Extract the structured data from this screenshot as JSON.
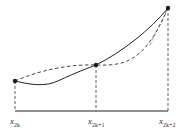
{
  "diagram": {
    "type": "simpson-rule-interpolation",
    "colors": {
      "stroke": "#222222",
      "dash": "#333333",
      "point": "#1a1a1a"
    },
    "points": [
      {
        "id": "p0",
        "x": 15,
        "y": 81
      },
      {
        "id": "p1",
        "x": 96,
        "y": 65
      },
      {
        "id": "p2",
        "x": 168,
        "y": 8
      }
    ],
    "baseline_y": 111,
    "labels": [
      {
        "base": "x",
        "sub": "2k",
        "x": 10,
        "y": 117
      },
      {
        "base": "x",
        "sub": "2k+1",
        "x": 88,
        "y": 117
      },
      {
        "base": "x",
        "sub": "2k+2",
        "x": 159,
        "y": 117
      }
    ],
    "curves": {
      "solid": "actual function curve",
      "dashed": "interpolating parabola / chords"
    }
  }
}
